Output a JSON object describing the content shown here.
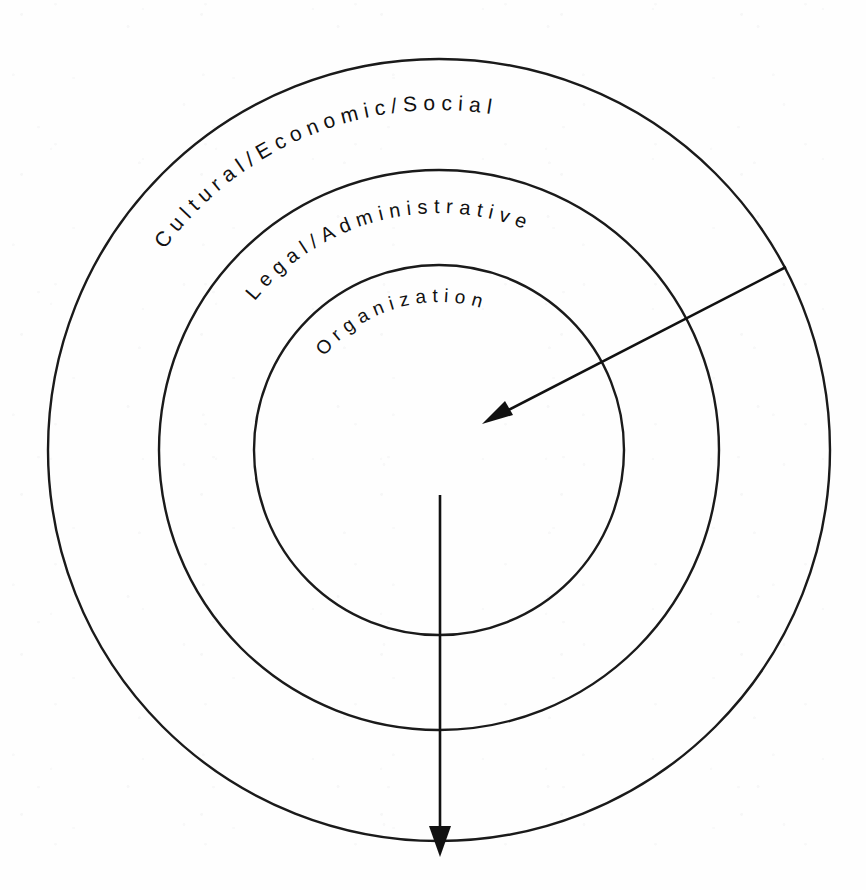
{
  "diagram": {
    "type": "concentric-circles",
    "background_color": "#fefefe",
    "line_color": "#1a1a1a",
    "rings": [
      {
        "id": "outer",
        "label": "Cultural/Economic/Social",
        "level": 1,
        "center_x": 439,
        "center_y": 450,
        "radius": 391,
        "stroke_width": 2.4
      },
      {
        "id": "middle",
        "label": "Legal/Administrative",
        "level": 2,
        "center_x": 439,
        "center_y": 450,
        "radius": 280,
        "stroke_width": 2.4
      },
      {
        "id": "inner",
        "label": "Organization",
        "level": 3,
        "center_x": 439,
        "center_y": 450,
        "radius": 185,
        "stroke_width": 2.4
      }
    ],
    "arrows": [
      {
        "id": "diagonal-inward-arrow",
        "name": "environment-influence-arrow",
        "from_x": 786,
        "from_y": 267,
        "to_x": 482,
        "to_y": 424,
        "direction": "inward"
      },
      {
        "id": "vertical-outward-arrow",
        "name": "organization-output-arrow",
        "from_x": 440,
        "from_y": 495,
        "to_x": 440,
        "to_y": 856,
        "direction": "outward"
      }
    ]
  },
  "labels": {
    "outer_ring": "Cultural/Economic/Social",
    "middle_ring": "Legal/Administrative",
    "inner_ring": "Organization"
  }
}
